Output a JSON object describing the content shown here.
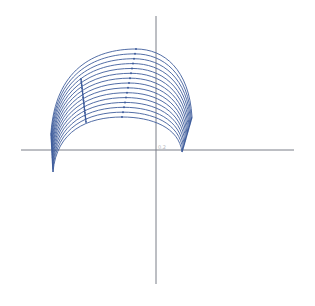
{
  "chart_data": {
    "type": "line",
    "title": "",
    "xlabel": "",
    "ylabel": "",
    "grid": false,
    "legend": null,
    "annotations": [
      "0.2"
    ],
    "colors": {
      "curves": "#3f5d9c",
      "axes": "#7a7f88",
      "label": "#b5b8be"
    },
    "axes_pixels": {
      "x_axis": {
        "x1": 21,
        "x2": 294,
        "y": 150
      },
      "y_axis": {
        "x": 156,
        "y1": 16,
        "y2": 284
      }
    },
    "series_description": "Family of 15 nested parabolic arcs; outer arc from (51,133) through apex (136,49) to (192,117); inner arc from (53,172) through apex (122,117) to (182,152). Dots mark apex ridge and a secondary ridge.",
    "series_count": 15,
    "outer_arc": {
      "left": [
        51,
        133
      ],
      "apex": [
        136,
        49
      ],
      "right": [
        192,
        117
      ]
    },
    "inner_arc": {
      "left": [
        53,
        172
      ],
      "apex": [
        122,
        117
      ],
      "right": [
        182,
        152
      ]
    },
    "ridge_secondary": {
      "outer": [
        81,
        79
      ],
      "inner": [
        86,
        122
      ]
    }
  },
  "labels": {
    "origin_label": "0.2"
  }
}
